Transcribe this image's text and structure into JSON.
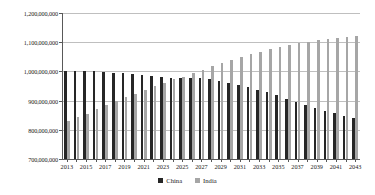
{
  "chart_data": {
    "type": "bar",
    "title": "",
    "subtitle": "",
    "xlabel": "",
    "ylabel": "",
    "ylim": [
      700000000,
      1200000000
    ],
    "ytick_values": [
      700000000,
      800000000,
      900000000,
      1000000000,
      1100000000,
      1200000000
    ],
    "ytick_labels": [
      "700,000,000",
      "800,000,000",
      "900,000,000",
      "1,000,000,000",
      "1,100,000,000",
      "1,200,000,000"
    ],
    "grid": true,
    "legend_position": "bottom",
    "categories": [
      "2013",
      "2014",
      "2015",
      "2016",
      "2017",
      "2018",
      "2019",
      "2020",
      "2021",
      "2022",
      "2023",
      "2024",
      "2025",
      "2026",
      "2027",
      "2028",
      "2029",
      "2030",
      "2031",
      "2032",
      "2033",
      "2034",
      "2035",
      "2036",
      "2037",
      "2038",
      "2039",
      "2040",
      "2041",
      "2042",
      "2043"
    ],
    "xtick_labels": [
      "2013",
      "",
      "2015",
      "",
      "2017",
      "",
      "2019",
      "",
      "2021",
      "",
      "2023",
      "",
      "2025",
      "",
      "2027",
      "",
      "2029",
      "",
      "2031",
      "",
      "2033",
      "",
      "2035",
      "",
      "2037",
      "",
      "2039",
      "",
      "2041",
      "",
      "2043"
    ],
    "series": [
      {
        "name": "China",
        "color": "#262626",
        "values": [
          1000000000,
          1000000000,
          1000000000,
          1000000000,
          997000000,
          995000000,
          993000000,
          990000000,
          987000000,
          984000000,
          981000000,
          979000000,
          979000000,
          978000000,
          976000000,
          973000000,
          968000000,
          961000000,
          955000000,
          946000000,
          938000000,
          928000000,
          918000000,
          907000000,
          896000000,
          884000000,
          874000000,
          864000000,
          856000000,
          849000000,
          842000000
        ]
      },
      {
        "name": "India",
        "color": "#a6a6a6",
        "values": [
          830000000,
          843000000,
          853000000,
          872000000,
          886000000,
          899000000,
          911000000,
          924000000,
          937000000,
          950000000,
          962000000,
          973000000,
          982000000,
          993000000,
          1005000000,
          1017000000,
          1029000000,
          1040000000,
          1050000000,
          1060000000,
          1068000000,
          1076000000,
          1083000000,
          1090000000,
          1096000000,
          1101000000,
          1106000000,
          1110000000,
          1114000000,
          1117000000,
          1121000000
        ]
      }
    ]
  },
  "legend": {
    "items": [
      {
        "label": "China",
        "swatch_name": "legend-swatch-china"
      },
      {
        "label": "India",
        "swatch_name": "legend-swatch-india"
      }
    ]
  }
}
